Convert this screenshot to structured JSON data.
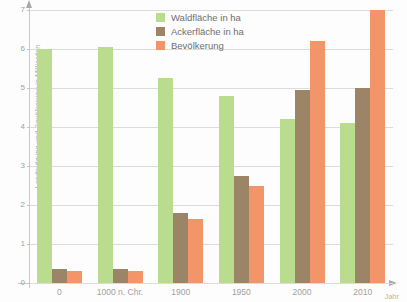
{
  "chart_data": {
    "type": "bar",
    "title": "",
    "xlabel": "Jahr",
    "ylabel": "Landnutzung und Bevölkerung in Milliarden",
    "categories": [
      "0",
      "1000 n. Chr.",
      "1900",
      "1950",
      "2000",
      "2010"
    ],
    "ylim": [
      0,
      7
    ],
    "yticks": [
      "0",
      "1",
      "2",
      "3",
      "4",
      "5",
      "6",
      "7"
    ],
    "grid": true,
    "legend_position": "top-center",
    "series": [
      {
        "name": "Waldfläche in ha",
        "color": "#b9dc8e",
        "values": [
          6.0,
          6.05,
          5.25,
          4.8,
          4.2,
          4.1
        ]
      },
      {
        "name": "Ackerfläche in ha",
        "color": "#9c8466",
        "values": [
          0.35,
          0.35,
          1.8,
          2.75,
          4.95,
          5.0
        ]
      },
      {
        "name": "Bevölkerung",
        "color": "#f2966a",
        "values": [
          0.3,
          0.3,
          1.65,
          2.5,
          6.2,
          7.0
        ]
      }
    ]
  },
  "colors": {
    "wald": "#b9dc8e",
    "acker": "#9c8466",
    "bevoelkerung": "#f2966a",
    "grid": "#dcdcdc",
    "axis": "#c9c9c9",
    "background": "#fdfdfd"
  }
}
